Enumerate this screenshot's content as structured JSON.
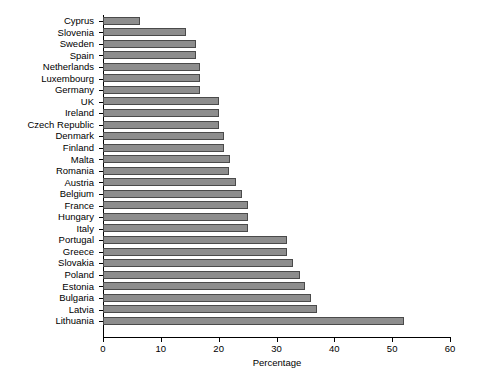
{
  "chart_data": {
    "type": "bar",
    "orientation": "horizontal",
    "title": "",
    "xlabel": "Percentage",
    "ylabel": "",
    "xlim": [
      0,
      60
    ],
    "xticks": [
      0,
      10,
      20,
      30,
      40,
      50,
      60
    ],
    "grid": false,
    "legend": null,
    "bar_color": "#8d8d8d",
    "bar_edge_color": "#4a4a4a",
    "background_color": "#ffffff",
    "axis_color": "#000000",
    "categories": [
      "Cyprus",
      "Slovenia",
      "Sweden",
      "Spain",
      "Netherlands",
      "Luxembourg",
      "Germany",
      "UK",
      "Ireland",
      "Czech Republic",
      "Denmark",
      "Finland",
      "Malta",
      "Romania",
      "Austria",
      "Belgium",
      "France",
      "Hungary",
      "Italy",
      "Portugal",
      "Greece",
      "Slovakia",
      "Poland",
      "Estonia",
      "Bulgaria",
      "Latvia",
      "Lithuania"
    ],
    "values": [
      6.4,
      14.3,
      16.0,
      16.0,
      16.8,
      16.8,
      16.8,
      20.0,
      20.0,
      20.0,
      21.0,
      21.0,
      22.0,
      21.8,
      23.0,
      24.0,
      25.0,
      25.0,
      25.0,
      31.8,
      31.8,
      32.8,
      34.0,
      35.0,
      36.0,
      37.0,
      52.0
    ]
  }
}
